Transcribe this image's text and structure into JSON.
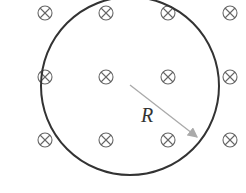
{
  "diagram": {
    "radius_label": "R",
    "field_symbol": "into-page (⊗)",
    "field_grid": {
      "cols_x": [
        45,
        106,
        168,
        230
      ],
      "rows_y": [
        13,
        77,
        140
      ]
    },
    "circle": {
      "cx": 130,
      "cy": 86,
      "r": 89,
      "color": "#333333"
    },
    "radius_arrow": {
      "x1": 130,
      "y1": 85,
      "x2": 198,
      "y2": 138,
      "color": "#aaaaaa"
    }
  }
}
